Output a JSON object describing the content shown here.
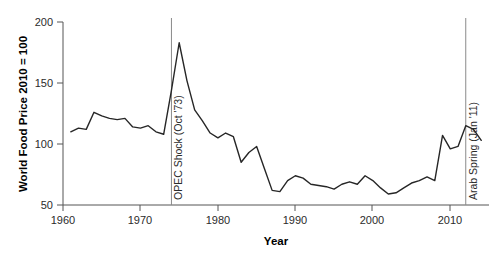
{
  "chart_data": {
    "type": "line",
    "title": "",
    "xlabel": "Year",
    "ylabel": "World Food Price 2010 = 100",
    "xlim": [
      1959,
      2014
    ],
    "ylim": [
      50,
      205
    ],
    "grid": false,
    "legend": "none",
    "xticks": [
      1960,
      1970,
      1980,
      1990,
      2000,
      2010
    ],
    "xtick_labels": [
      "1960",
      "1970",
      "1980",
      "1990",
      "2000",
      "2010"
    ],
    "yticks": [
      50,
      100,
      150,
      200
    ],
    "ytick_labels": [
      "50",
      "100",
      "150",
      "200"
    ],
    "series": [
      {
        "name": "World Food Price Index (2010 = 100)",
        "color": "#262626",
        "x": [
          1960,
          1961,
          1962,
          1963,
          1964,
          1965,
          1966,
          1967,
          1968,
          1969,
          1970,
          1971,
          1972,
          1973,
          1974,
          1975,
          1976,
          1977,
          1978,
          1979,
          1980,
          1981,
          1982,
          1983,
          1984,
          1985,
          1986,
          1987,
          1988,
          1989,
          1990,
          1991,
          1992,
          1993,
          1994,
          1995,
          1996,
          1997,
          1998,
          1999,
          2000,
          2001,
          2002,
          2003,
          2004,
          2005,
          2006,
          2007,
          2008,
          2009,
          2010,
          2011,
          2012,
          2013
        ],
        "values": [
          110,
          113,
          112,
          126,
          123,
          121,
          120,
          121,
          114,
          113,
          115,
          110,
          108,
          144,
          183,
          152,
          128,
          119,
          109,
          105,
          109,
          106,
          85,
          93,
          98,
          80,
          62,
          61,
          70,
          74,
          72,
          67,
          66,
          65,
          63,
          67,
          69,
          67,
          74,
          70,
          64,
          59,
          60,
          64,
          68,
          70,
          73,
          70,
          107,
          96,
          98,
          115,
          112,
          103
        ]
      }
    ],
    "annotations": [
      {
        "id": "opec-shock",
        "label": "OPEC Shock (Oct '73)",
        "x": 1973,
        "type": "vertical-line",
        "color": "#8a8a8a",
        "text_orientation": "vertical"
      },
      {
        "id": "arab-spring",
        "label": "Arab Spring (Jan '11)",
        "x": 2011,
        "type": "vertical-line",
        "color": "#8a8a8a",
        "text_orientation": "vertical"
      }
    ]
  },
  "axes": {
    "y_title": "World Food Price 2010 = 100",
    "x_title": "Year",
    "y_ticks": [
      "200",
      "150",
      "100",
      "50"
    ],
    "x_ticks": [
      "1960",
      "1970",
      "1980",
      "1990",
      "2000",
      "2010"
    ]
  },
  "annotations": {
    "opec_label": "OPEC Shock (Oct '73)",
    "arab_spring_label": "Arab Spring (Jan '11)"
  },
  "colors": {
    "series": "#262626",
    "axis": "#555555",
    "annotation_line": "#8a8a8a",
    "background": "#ffffff"
  }
}
